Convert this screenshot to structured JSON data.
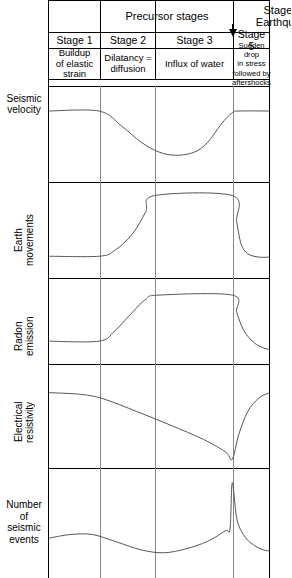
{
  "figure": {
    "type": "multi-panel-line-chart"
  },
  "header": {
    "precursor_label": "Precursor stages",
    "earthquake_label_line1": "Stage 4:",
    "earthquake_label_line2": "Earthquake",
    "earthquake_marker_icon": "down-arrow-icon"
  },
  "stages": [
    {
      "id": "stage1",
      "name": "Stage 1",
      "description": "Buildup\nof elastic\nstrain"
    },
    {
      "id": "stage2",
      "name": "Stage 2",
      "description": "Dilatancy =\ndiffusion"
    },
    {
      "id": "stage3",
      "name": "Stage 3",
      "description": "Influx of water"
    },
    {
      "id": "stage5",
      "name": "Stage 5",
      "description": "Sudden drop\nin stress\nfollowed by\naftershocks"
    }
  ],
  "rows": [
    {
      "id": "seismic-velocity",
      "label": "Seismic\nvelocity",
      "orientation": "horizontal"
    },
    {
      "id": "earth-movements",
      "label": "Earth\nmovements",
      "orientation": "vertical"
    },
    {
      "id": "radon-emission",
      "label": "Radon\nemission",
      "orientation": "vertical"
    },
    {
      "id": "electrical-resistivity",
      "label": "Electrical\nresistivity",
      "orientation": "vertical"
    },
    {
      "id": "seismic-events",
      "label": "Number\nof\nseismic\nevents",
      "orientation": "horizontal"
    }
  ],
  "chart_data": {
    "type": "line",
    "xlabel": "",
    "ylabel": "",
    "grid": true,
    "legend": null,
    "x_axis": {
      "type": "categorical-stages",
      "stage_boundaries_pct": [
        0,
        23.4,
        48.2,
        83.3,
        100
      ],
      "stage_names": [
        "Stage 1",
        "Stage 2",
        "Stage 3",
        "Stage 5"
      ],
      "earthquake_x_pct": 83.3
    },
    "panels": [
      {
        "name": "Seismic velocity",
        "ylim": [
          0,
          1
        ],
        "description": "High and flat through Stage 1, falls through Stage 2 to a minimum in Stage 3, recovers before the earthquake, then flat high.",
        "points": [
          {
            "x": 0,
            "y": 0.78
          },
          {
            "x": 23,
            "y": 0.78
          },
          {
            "x": 33,
            "y": 0.6
          },
          {
            "x": 42,
            "y": 0.4
          },
          {
            "x": 50,
            "y": 0.28
          },
          {
            "x": 58,
            "y": 0.24
          },
          {
            "x": 66,
            "y": 0.28
          },
          {
            "x": 72,
            "y": 0.4
          },
          {
            "x": 78,
            "y": 0.62
          },
          {
            "x": 83,
            "y": 0.76
          },
          {
            "x": 86,
            "y": 0.78
          },
          {
            "x": 100,
            "y": 0.78
          }
        ]
      },
      {
        "name": "Earth movements",
        "ylim": [
          0,
          1
        ],
        "description": "Low and flat through Stage 1, rises steeply through Stage 2, plateaus high through Stage 3, drops abruptly at the earthquake, then flat low.",
        "points": [
          {
            "x": 0,
            "y": 0.18
          },
          {
            "x": 23,
            "y": 0.18
          },
          {
            "x": 30,
            "y": 0.25
          },
          {
            "x": 38,
            "y": 0.45
          },
          {
            "x": 44,
            "y": 0.72
          },
          {
            "x": 48,
            "y": 0.92
          },
          {
            "x": 83,
            "y": 0.92
          },
          {
            "x": 85,
            "y": 0.6
          },
          {
            "x": 87,
            "y": 0.33
          },
          {
            "x": 90,
            "y": 0.21
          },
          {
            "x": 95,
            "y": 0.17
          },
          {
            "x": 100,
            "y": 0.17
          }
        ]
      },
      {
        "name": "Radon emission",
        "ylim": [
          0,
          1
        ],
        "description": "Low and flat through Stage 1, S-shaped rise through Stage 2, plateaus high through Stage 3, drops sharply at the earthquake and decays.",
        "points": [
          {
            "x": 0,
            "y": 0.22
          },
          {
            "x": 23,
            "y": 0.22
          },
          {
            "x": 30,
            "y": 0.36
          },
          {
            "x": 38,
            "y": 0.62
          },
          {
            "x": 44,
            "y": 0.8
          },
          {
            "x": 50,
            "y": 0.86
          },
          {
            "x": 83,
            "y": 0.86
          },
          {
            "x": 85,
            "y": 0.62
          },
          {
            "x": 88,
            "y": 0.38
          },
          {
            "x": 92,
            "y": 0.22
          },
          {
            "x": 96,
            "y": 0.14
          },
          {
            "x": 100,
            "y": 0.1
          }
        ]
      },
      {
        "name": "Electrical resistivity",
        "ylim": [
          0,
          1
        ],
        "description": "Starts high, declines steadily through Stages 2 and 3 to a minimum at the earthquake, then rises sharply afterwards.",
        "points": [
          {
            "x": 0,
            "y": 0.76
          },
          {
            "x": 15,
            "y": 0.74
          },
          {
            "x": 25,
            "y": 0.69
          },
          {
            "x": 40,
            "y": 0.55
          },
          {
            "x": 55,
            "y": 0.4
          },
          {
            "x": 70,
            "y": 0.24
          },
          {
            "x": 80,
            "y": 0.1
          },
          {
            "x": 83,
            "y": 0.02
          },
          {
            "x": 86,
            "y": 0.3
          },
          {
            "x": 90,
            "y": 0.55
          },
          {
            "x": 95,
            "y": 0.7
          },
          {
            "x": 100,
            "y": 0.76
          }
        ]
      },
      {
        "name": "Number of seismic events",
        "ylim": [
          0,
          1
        ],
        "description": "Small foreshock rise in Stage 1, quiescence dip in Stages 2-3, gradual increase, sharp mainshock spike at the earthquake, then aftershock decay.",
        "points": [
          {
            "x": 0,
            "y": 0.34
          },
          {
            "x": 10,
            "y": 0.38
          },
          {
            "x": 20,
            "y": 0.38
          },
          {
            "x": 30,
            "y": 0.31
          },
          {
            "x": 42,
            "y": 0.22
          },
          {
            "x": 52,
            "y": 0.19
          },
          {
            "x": 62,
            "y": 0.23
          },
          {
            "x": 72,
            "y": 0.31
          },
          {
            "x": 80,
            "y": 0.42
          },
          {
            "x": 82,
            "y": 0.44
          },
          {
            "x": 83,
            "y": 0.92
          },
          {
            "x": 85,
            "y": 0.55
          },
          {
            "x": 88,
            "y": 0.38
          },
          {
            "x": 92,
            "y": 0.28
          },
          {
            "x": 97,
            "y": 0.22
          },
          {
            "x": 100,
            "y": 0.21
          }
        ]
      }
    ]
  },
  "colors": {
    "line": "#555555",
    "rule": "#000000",
    "grid": "#888888",
    "background": "#ffffff"
  }
}
